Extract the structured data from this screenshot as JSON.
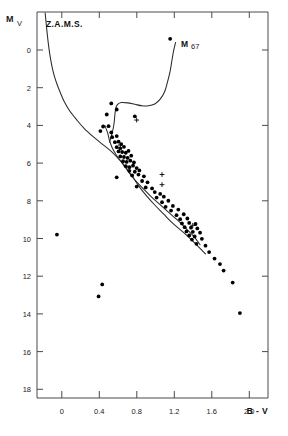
{
  "figure": {
    "name": "colour-magnitude-diagram",
    "background": "#ffffff",
    "ink_color": "#1a1a1a"
  },
  "annotations": {
    "zams_label": "Z.A.M.S.",
    "cluster_label": "M 67",
    "cluster_label_main": "M",
    "cluster_label_sub": "67"
  },
  "caption": {
    "text": "",
    "visible": false
  },
  "chart_data": {
    "type": "scatter",
    "title": "",
    "subtitle": "",
    "xlabel": "B - V",
    "ylabel": "M",
    "ylabel_subscript": "V",
    "xlim": [
      -0.3,
      2.25
    ],
    "ylim": [
      19.3,
      -1.6
    ],
    "y_inverted": true,
    "grid": false,
    "legend_position": "none",
    "xticks": [
      0,
      0.4,
      0.8,
      1.2,
      1.6,
      2.0
    ],
    "xtick_labels": [
      "0",
      "0.4",
      "0.8",
      "1.2",
      "1.6",
      "2.0"
    ],
    "yticks": [
      0,
      2,
      4,
      6,
      8,
      10,
      12,
      14,
      16,
      18
    ],
    "ytick_labels": [
      "0",
      "2",
      "4",
      "6",
      "8",
      "10",
      "12",
      "14",
      "16",
      "18"
    ],
    "series": [
      {
        "name": "Z.A.M.S.",
        "type": "line",
        "annotation": "Z.A.M.S.",
        "points": [
          [
            -0.21,
            -1.55
          ],
          [
            -0.19,
            -0.55
          ],
          [
            -0.17,
            0.3
          ],
          [
            -0.15,
            0.95
          ],
          [
            -0.13,
            1.45
          ],
          [
            -0.11,
            1.85
          ],
          [
            -0.08,
            2.3
          ],
          [
            -0.04,
            2.8
          ],
          [
            0.0,
            3.25
          ],
          [
            0.06,
            3.75
          ],
          [
            0.14,
            4.25
          ],
          [
            0.22,
            4.7
          ],
          [
            0.32,
            5.15
          ],
          [
            0.42,
            5.55
          ],
          [
            0.52,
            5.95
          ],
          [
            0.58,
            6.25
          ],
          [
            0.64,
            6.55
          ],
          [
            0.7,
            6.95
          ],
          [
            0.76,
            7.35
          ],
          [
            0.82,
            7.8
          ],
          [
            0.9,
            8.3
          ],
          [
            1.0,
            8.85
          ],
          [
            1.1,
            9.35
          ],
          [
            1.2,
            9.85
          ],
          [
            1.32,
            10.35
          ],
          [
            1.44,
            10.9
          ],
          [
            1.56,
            11.5
          ]
        ]
      },
      {
        "name": "M 67 fiducial sequence",
        "type": "line",
        "annotation": "M 67",
        "points": [
          [
            0.5,
            5.45
          ],
          [
            0.53,
            4.95
          ],
          [
            0.55,
            4.45
          ],
          [
            0.56,
            3.95
          ],
          [
            0.57,
            3.6
          ],
          [
            0.59,
            3.4
          ],
          [
            0.63,
            3.3
          ],
          [
            0.7,
            3.32
          ],
          [
            0.78,
            3.4
          ],
          [
            0.86,
            3.48
          ],
          [
            0.93,
            3.48
          ],
          [
            1.0,
            3.38
          ],
          [
            1.06,
            3.12
          ],
          [
            1.11,
            2.7
          ],
          [
            1.14,
            2.2
          ],
          [
            1.17,
            1.6
          ],
          [
            1.19,
            1.0
          ],
          [
            1.21,
            0.45
          ],
          [
            1.23,
            0.05
          ]
        ]
      },
      {
        "name": "M 67 main sequence ridge",
        "type": "line",
        "points": [
          [
            0.45,
            4.55
          ],
          [
            0.48,
            4.95
          ],
          [
            0.5,
            5.35
          ],
          [
            0.53,
            5.75
          ],
          [
            0.57,
            6.1
          ],
          [
            0.62,
            6.45
          ],
          [
            0.68,
            6.85
          ],
          [
            0.74,
            7.25
          ],
          [
            0.8,
            7.6
          ],
          [
            0.88,
            8.0
          ],
          [
            0.96,
            8.4
          ],
          [
            1.04,
            8.75
          ],
          [
            1.12,
            9.1
          ],
          [
            1.2,
            9.45
          ],
          [
            1.28,
            9.8
          ],
          [
            1.36,
            10.2
          ],
          [
            1.44,
            10.6
          ],
          [
            1.5,
            11.0
          ]
        ]
      },
      {
        "name": "M 67 member stars",
        "type": "scatter",
        "marker": "filled-circle",
        "points": [
          [
            1.17,
            -0.15
          ],
          [
            0.52,
            3.35
          ],
          [
            0.58,
            3.68
          ],
          [
            0.47,
            3.95
          ],
          [
            0.78,
            4.05
          ],
          [
            0.43,
            4.6
          ],
          [
            0.49,
            4.58
          ],
          [
            0.4,
            4.85
          ],
          [
            0.52,
            4.92
          ],
          [
            0.53,
            5.18
          ],
          [
            0.58,
            5.12
          ],
          [
            0.56,
            5.45
          ],
          [
            0.6,
            5.42
          ],
          [
            0.63,
            5.55
          ],
          [
            0.58,
            5.72
          ],
          [
            0.62,
            5.78
          ],
          [
            0.66,
            5.7
          ],
          [
            0.6,
            5.95
          ],
          [
            0.64,
            5.98
          ],
          [
            0.68,
            6.02
          ],
          [
            0.71,
            5.92
          ],
          [
            0.62,
            6.22
          ],
          [
            0.66,
            6.25
          ],
          [
            0.7,
            6.3
          ],
          [
            0.74,
            6.18
          ],
          [
            0.65,
            6.48
          ],
          [
            0.69,
            6.52
          ],
          [
            0.73,
            6.45
          ],
          [
            0.77,
            6.55
          ],
          [
            0.68,
            6.75
          ],
          [
            0.72,
            6.8
          ],
          [
            0.76,
            6.72
          ],
          [
            0.8,
            6.85
          ],
          [
            0.72,
            7.0
          ],
          [
            0.78,
            7.05
          ],
          [
            0.83,
            6.98
          ],
          [
            0.75,
            7.25
          ],
          [
            0.82,
            7.2
          ],
          [
            0.88,
            7.3
          ],
          [
            0.58,
            7.35
          ],
          [
            0.86,
            7.55
          ],
          [
            0.92,
            7.62
          ],
          [
            0.8,
            7.85
          ],
          [
            0.9,
            7.9
          ],
          [
            0.97,
            7.95
          ],
          [
            1.0,
            8.15
          ],
          [
            1.06,
            8.25
          ],
          [
            1.02,
            8.45
          ],
          [
            1.1,
            8.4
          ],
          [
            1.08,
            8.7
          ],
          [
            1.15,
            8.62
          ],
          [
            1.12,
            8.95
          ],
          [
            1.2,
            8.9
          ],
          [
            1.18,
            9.15
          ],
          [
            1.26,
            9.1
          ],
          [
            1.24,
            9.4
          ],
          [
            1.32,
            9.35
          ],
          [
            1.28,
            9.62
          ],
          [
            1.36,
            9.58
          ],
          [
            1.3,
            9.85
          ],
          [
            1.38,
            9.82
          ],
          [
            1.45,
            9.88
          ],
          [
            1.33,
            10.05
          ],
          [
            1.4,
            10.08
          ],
          [
            1.47,
            10.12
          ],
          [
            1.35,
            10.28
          ],
          [
            1.42,
            10.3
          ],
          [
            1.5,
            10.35
          ],
          [
            1.38,
            10.5
          ],
          [
            1.44,
            10.55
          ],
          [
            1.41,
            10.72
          ],
          [
            1.52,
            10.68
          ],
          [
            1.46,
            10.95
          ],
          [
            1.56,
            11.05
          ],
          [
            1.6,
            11.4
          ],
          [
            1.66,
            11.75
          ],
          [
            1.72,
            12.05
          ],
          [
            1.76,
            12.4
          ],
          [
            1.86,
            13.05
          ],
          [
            1.94,
            14.7
          ],
          [
            -0.08,
            10.45
          ],
          [
            0.42,
            13.15
          ],
          [
            0.38,
            13.8
          ]
        ]
      },
      {
        "name": "M 67 uncertain / non-member stars",
        "type": "scatter",
        "marker": "cross",
        "points": [
          [
            0.8,
            4.25
          ],
          [
            0.62,
            5.6
          ],
          [
            1.08,
            7.2
          ],
          [
            1.08,
            7.75
          ],
          [
            1.42,
            9.95
          ]
        ]
      }
    ]
  }
}
